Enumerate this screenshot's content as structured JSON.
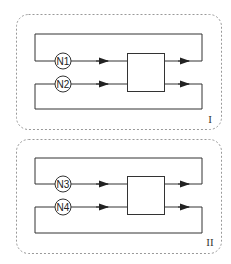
{
  "diagram": {
    "colors": {
      "line": "#333333",
      "dashed": "#888888",
      "background": "#ffffff"
    },
    "panels": [
      {
        "id": "panel-1",
        "label": "I",
        "nodes": [
          {
            "label": "N1"
          },
          {
            "label": "N2"
          }
        ]
      },
      {
        "id": "panel-2",
        "label": "II",
        "nodes": [
          {
            "label": "N3"
          },
          {
            "label": "N4"
          }
        ]
      }
    ]
  }
}
